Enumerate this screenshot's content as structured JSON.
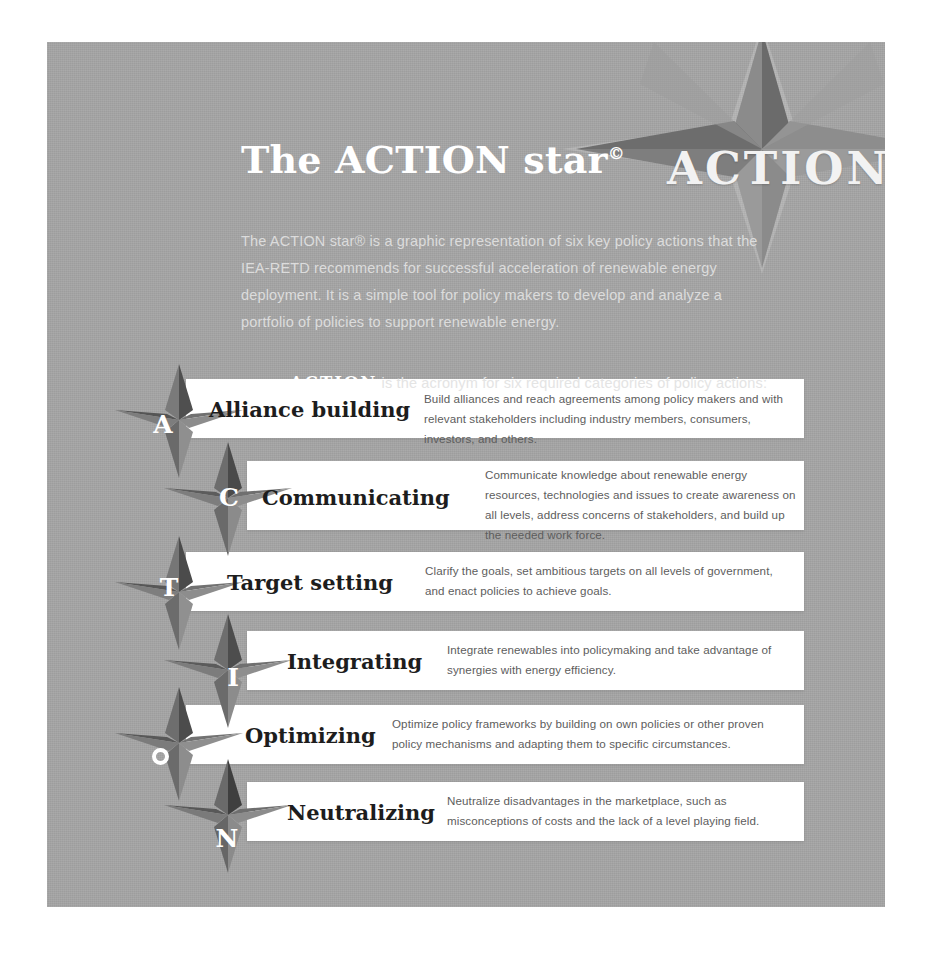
{
  "header": {
    "title": "The ACTION star",
    "title_superscript": "©",
    "intro": "The ACTION star® is a graphic representation of six key policy actions that the IEA-RETD recommends for successful acceleration of renewable energy deployment. It is a simple tool for policy makers to develop and analyze a portfolio of policies to support renewable energy.",
    "acronym_keyword": "ACTION",
    "acronym_sentence": "is the acronym for six required categories of policy actions:"
  },
  "logo": {
    "word": "ACTION",
    "icon": "six-pointed-star"
  },
  "colors": {
    "panel_background": "#a6a6a6",
    "bar_background": "#ffffff",
    "star_dark": "#4a4a4a",
    "star_mid": "#6f6f6f",
    "star_light": "#8e8e8e",
    "title_text": "#ffffff",
    "body_text": "#dcdcdc",
    "label_text": "#1d1d1d",
    "desc_text": "#5d5d5d"
  },
  "rows": [
    {
      "letter": "A",
      "label": "Alliance building",
      "description": "Build alliances and reach agreements among policy makers and with relevant stakeholders including industry members, consumers, investors, and others."
    },
    {
      "letter": "C",
      "label": "Communicating",
      "description": "Communicate knowledge about renewable energy resources, technologies and issues to create awareness on all levels, address concerns of stakeholders, and build up the needed work force."
    },
    {
      "letter": "T",
      "label": "Target setting",
      "description": "Clarify the goals, set ambitious targets on all levels of government, and enact policies to achieve goals."
    },
    {
      "letter": "I",
      "label": "Integrating",
      "description": "Integrate renewables into policymaking and take advantage of synergies with energy efficiency."
    },
    {
      "letter": "O",
      "label": "Optimizing",
      "description": "Optimize policy frameworks by building on own policies or other proven policy mechanisms and adapting them to specific circumstances."
    },
    {
      "letter": "N",
      "label": "Neutralizing",
      "description": "Neutralize disadvantages in the marketplace, such as misconceptions of costs and the lack of a level playing field."
    }
  ]
}
